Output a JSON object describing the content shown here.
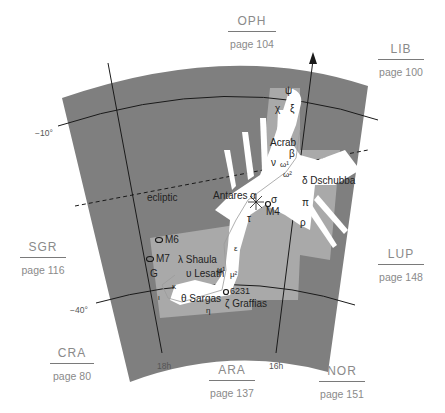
{
  "map": {
    "constellation": "Scorpius",
    "colors": {
      "outer_sky": "#7f7f7f",
      "constellation_area": "#a9a9a9",
      "figure": "#ffffff",
      "lines": "#1a1a1a",
      "neighbor_text": "#8a8a8a"
    },
    "neighbors": [
      {
        "abbr": "OPH",
        "page": "page 104"
      },
      {
        "abbr": "LIB",
        "page": "page 100"
      },
      {
        "abbr": "SGR",
        "page": "page 116"
      },
      {
        "abbr": "LUP",
        "page": "page 148"
      },
      {
        "abbr": "CRA",
        "page": "page 80"
      },
      {
        "abbr": "ARA",
        "page": "page 137"
      },
      {
        "abbr": "NOR",
        "page": "page 151"
      }
    ],
    "axes": {
      "dec_labels": [
        "−10°",
        "−40°"
      ],
      "ra_labels": [
        "18h",
        "16h"
      ]
    },
    "ecliptic_label": "ecliptic",
    "stars": {
      "psi": "ψ",
      "chi": "χ",
      "xi": "ξ",
      "acrab": "Acrab",
      "beta": "β",
      "nu": "ν",
      "omega1": "ω¹",
      "omega2": "ω²",
      "dschubba": "δ Dschubba",
      "pi": "π",
      "rho": "ρ",
      "antares": "Antares α",
      "sigma": "σ",
      "m4": "M4",
      "tau": "τ",
      "epsilon": "ε",
      "mu1": "μ¹",
      "mu2": "μ²",
      "m6": "M6",
      "m7": "M7",
      "shaula": "λ Shaula",
      "lesath": "υ Lesath",
      "g": "G",
      "kappa": "κ",
      "iota": "ι",
      "sargas": "θ Sargas",
      "ngc6231": "6231",
      "graffias": "ζ Graffias",
      "eta": "η"
    }
  }
}
